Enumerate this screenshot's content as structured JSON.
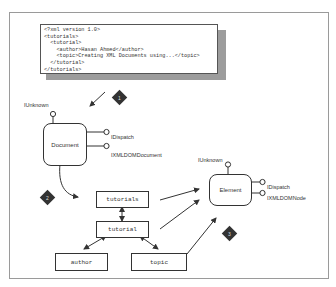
{
  "xml_code": {
    "lines": [
      "<?xml version 1.0>",
      "<tutorials>",
      "  <tutorial>",
      "    <author>Hasan Ahmed</author>",
      "    <topic>Creating XML Documents using...</topic>",
      "  </tutorial>",
      "</tutorials>"
    ]
  },
  "document_component": {
    "name": "Document",
    "interfaces": [
      "IUnknown",
      "IDispatch",
      "IXMLDOMDocument"
    ]
  },
  "element_component": {
    "name": "Element",
    "interfaces": [
      "IUnknown",
      "IDispatch",
      "IXMLDOMNode"
    ]
  },
  "tree_nodes": {
    "tutorials": "tutorials",
    "tutorial": "tutorial",
    "author": "author",
    "topic": "topic"
  },
  "steps": [
    "1",
    "2",
    "3"
  ],
  "colors": {
    "line": "#333333",
    "shadow": "#9c9c9c",
    "diamond": "#333333"
  }
}
